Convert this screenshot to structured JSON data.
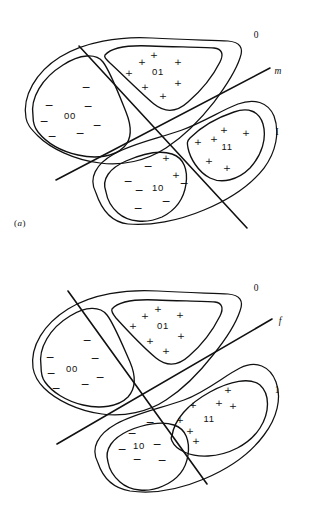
{
  "figure": {
    "background_color": "#ffffff",
    "stroke_color": "#111111",
    "width": 310,
    "height": 516
  },
  "panels": [
    {
      "id": "a",
      "caption_open": "(",
      "caption_letter": "a",
      "caption_close": ")",
      "boundary_line_label": "m",
      "class_label_top": "0",
      "class_label_bottom": "I",
      "regions": [
        {
          "code": "00",
          "sign": "-",
          "sign_count": 6
        },
        {
          "code": "01",
          "sign": "+",
          "sign_count": 7
        },
        {
          "code": "10",
          "sign": "-",
          "sign_count": 6,
          "outlier_sign": "+",
          "outlier_count": 2
        },
        {
          "code": "11",
          "sign": "+",
          "sign_count": 6
        }
      ]
    },
    {
      "id": "b",
      "caption_open": "(",
      "caption_letter": "b",
      "caption_close": ")",
      "boundary_line_label": "f",
      "class_label_top": "0",
      "class_label_bottom": "1",
      "regions": [
        {
          "code": "00",
          "sign": "-",
          "sign_count": 7
        },
        {
          "code": "01",
          "sign": "+",
          "sign_count": 7
        },
        {
          "code": "10",
          "sign": "-",
          "sign_count": 6
        },
        {
          "code": "11",
          "sign": "+",
          "sign_count": 7
        }
      ]
    }
  ],
  "symbols": {
    "plus": "+",
    "minus": "−"
  }
}
